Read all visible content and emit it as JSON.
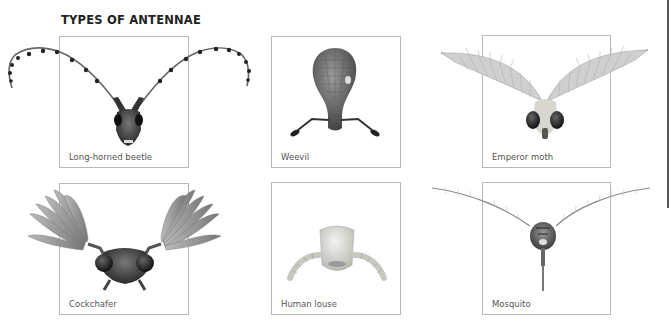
{
  "page": {
    "title": "TYPES OF ANTENNAE"
  },
  "panels": [
    {
      "id": "long-horned-beetle",
      "label": "Long-horned beetle",
      "antenna_type": "filiform-segmented"
    },
    {
      "id": "weevil",
      "label": "Weevil",
      "antenna_type": "geniculate-clubbed"
    },
    {
      "id": "emperor-moth",
      "label": "Emperor moth",
      "antenna_type": "bipectinate-feathery"
    },
    {
      "id": "cockchafer",
      "label": "Cockchafer",
      "antenna_type": "lamellate"
    },
    {
      "id": "human-louse",
      "label": "Human louse",
      "antenna_type": "short-segmented"
    },
    {
      "id": "mosquito",
      "label": "Mosquito",
      "antenna_type": "plumose-fine"
    }
  ],
  "colors": {
    "box_border": "#b8b8b8",
    "label_text": "#555555",
    "title_text": "#222222",
    "page_edge": "#555555"
  }
}
